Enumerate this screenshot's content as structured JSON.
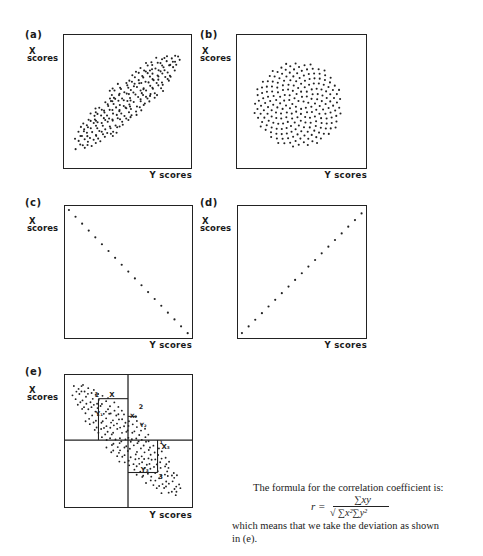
{
  "panels": [
    {
      "id": "a",
      "label": "(a)",
      "x_axis": "X scores",
      "y_axis": "Y scores",
      "description": "Positive correlation, elliptical cloud"
    },
    {
      "id": "b",
      "label": "(b)",
      "x_axis": "X scores",
      "y_axis": "Y scores",
      "description": "Zero correlation, circular cloud"
    },
    {
      "id": "c",
      "label": "(c)",
      "x_axis": "X scores",
      "y_axis": "Y scores",
      "description": "Perfect negative correlation"
    },
    {
      "id": "d",
      "label": "(d)",
      "x_axis": "X scores",
      "y_axis": "Y scores",
      "description": "Perfect positive correlation"
    },
    {
      "id": "e",
      "label": "(e)",
      "x_axis": "X scores",
      "y_axis": "Y scores",
      "description": "Negative correlation with deviations from means"
    }
  ],
  "axis_labels": {
    "x_top": "X",
    "x_bottom": "scores",
    "y": "Y scores"
  },
  "annotations_e": {
    "point1": {
      "num": "1",
      "x": "X",
      "y": "Y₁"
    },
    "point2": {
      "num": "2",
      "x": "X₂",
      "y": "Y₂"
    },
    "point3": {
      "num": "3",
      "x": "X₃",
      "y": "Y₃"
    }
  },
  "caption": {
    "intro": "The formula for the correlation coefficient is:",
    "formula_lhs": "r =",
    "formula_num": "∑xy",
    "formula_den": "√ ∑x²∑y²",
    "outro_line1": "which means that we take the deviation as shown",
    "outro_line2": "in (e)."
  },
  "chart_data": [
    {
      "type": "scatter",
      "title": "(a)",
      "xlabel": "Y scores",
      "ylabel": "X scores",
      "pattern": "positive correlation (~+0.8)",
      "grid": false
    },
    {
      "type": "scatter",
      "title": "(b)",
      "xlabel": "Y scores",
      "ylabel": "X scores",
      "pattern": "no correlation (~0)",
      "grid": false
    },
    {
      "type": "scatter",
      "title": "(c)",
      "xlabel": "Y scores",
      "ylabel": "X scores",
      "pattern": "perfect negative correlation (-1)",
      "grid": false,
      "x": [
        1,
        2,
        3,
        4,
        5,
        6,
        7,
        8,
        9,
        10,
        11,
        12,
        13,
        14,
        15,
        16,
        17,
        18,
        19
      ],
      "y": [
        19,
        18,
        17,
        16,
        15,
        14,
        13,
        12,
        11,
        10,
        9,
        8,
        7,
        6,
        5,
        4,
        3,
        2,
        1
      ]
    },
    {
      "type": "scatter",
      "title": "(d)",
      "xlabel": "Y scores",
      "ylabel": "X scores",
      "pattern": "perfect positive correlation (+1)",
      "grid": false,
      "x": [
        1,
        2,
        3,
        4,
        5,
        6,
        7,
        8,
        9,
        10,
        11,
        12,
        13,
        14,
        15,
        16,
        17,
        18,
        19
      ],
      "y": [
        1,
        2,
        3,
        4,
        5,
        6,
        7,
        8,
        9,
        10,
        11,
        12,
        13,
        14,
        15,
        16,
        17,
        18,
        19
      ]
    },
    {
      "type": "scatter",
      "title": "(e)",
      "xlabel": "Y scores",
      "ylabel": "X scores",
      "pattern": "negative correlation with quadrants at means",
      "grid": false
    }
  ]
}
